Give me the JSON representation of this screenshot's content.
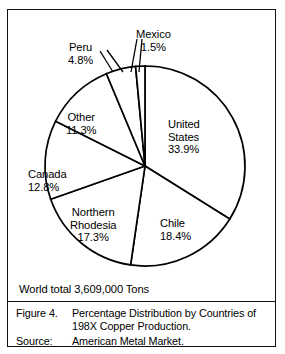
{
  "figure": {
    "world_total": "World total 3,609,000 Tons",
    "caption": {
      "figure_label": "Figure 4.",
      "title_line1": "Percentage Distribution by Countries of",
      "title_line2": "198X Copper Production.",
      "source_label": "Source:",
      "source_value": "American Metal Market."
    }
  },
  "chart_data": {
    "type": "pie",
    "title": "Percentage Distribution by Countries of 198X Copper Production.",
    "subtitle": "World total 3,609,000 Tons",
    "source": "American Metal Market.",
    "units": "percent",
    "total_label": "World total 3,609,000 Tons",
    "total_value": 3609000,
    "total_units": "Tons",
    "start_angle_deg": 0,
    "direction": "clockwise",
    "legend": "none (labels placed on slices)",
    "categories": [
      "United States",
      "Chile",
      "Northern Rhodesia",
      "Canada",
      "Other",
      "Peru",
      "Mexico"
    ],
    "values": [
      33.9,
      18.4,
      17.3,
      12.8,
      11.3,
      4.8,
      1.5
    ],
    "slices": [
      {
        "name": "United States",
        "pct": 33.9,
        "pct_label": "33.9%",
        "name_lines": [
          "United",
          "States"
        ]
      },
      {
        "name": "Chile",
        "pct": 18.4,
        "pct_label": "18.4%",
        "name_lines": [
          "Chile"
        ]
      },
      {
        "name": "Northern Rhodesia",
        "pct": 17.3,
        "pct_label": "17.3%",
        "name_lines": [
          "Northern",
          "Rhodesia"
        ]
      },
      {
        "name": "Canada",
        "pct": 12.8,
        "pct_label": "12.8%",
        "name_lines": [
          "Canada"
        ]
      },
      {
        "name": "Other",
        "pct": 11.3,
        "pct_label": "11.3%",
        "name_lines": [
          "Other"
        ]
      },
      {
        "name": "Peru",
        "pct": 4.8,
        "pct_label": "4.8%",
        "name_lines": [
          "Peru"
        ]
      },
      {
        "name": "Mexico",
        "pct": 1.5,
        "pct_label": "1.5%",
        "name_lines": [
          "Mexico"
        ]
      }
    ],
    "colors": {
      "slice_fill": "#ffffff",
      "slice_stroke": "#000000",
      "text": "#000000",
      "frame": "#111111"
    }
  },
  "labels": {
    "united_states": {
      "name": "United",
      "name2": "States",
      "pct": "33.9%"
    },
    "chile": {
      "name": "Chile",
      "pct": "18.4%"
    },
    "northern_rhodesia": {
      "name": "Northern",
      "name2": "Rhodesia",
      "pct": "17.3%"
    },
    "canada": {
      "name": "Canada",
      "pct": "12.8%"
    },
    "other": {
      "name": "Other",
      "pct": "11.3%"
    },
    "peru": {
      "name": "Peru",
      "pct": "4.8%"
    },
    "mexico": {
      "name": "Mexico",
      "pct": "1.5%"
    }
  }
}
